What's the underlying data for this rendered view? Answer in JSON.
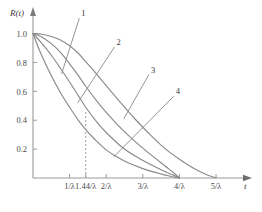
{
  "chart_data": {
    "type": "line",
    "title": "",
    "xlabel": "t",
    "ylabel": "R(t)",
    "grid": false,
    "legend_position": "inline-labels",
    "xlim": [
      0,
      5.6
    ],
    "ylim": [
      0,
      1.08
    ],
    "y_ticks": [
      "1.0",
      "0.8",
      "0.6",
      "0.4",
      "0.2"
    ],
    "y_tick_values": [
      1.0,
      0.8,
      0.6,
      0.4,
      0.2
    ],
    "x_ticks": [
      "1/λ",
      "1.44/λ",
      "2/λ",
      "3/λ",
      "4/λ",
      "5/λ"
    ],
    "x_tick_values": [
      1.0,
      1.44,
      2.0,
      3.0,
      4.0,
      5.0
    ],
    "annotations": [
      {
        "name": "dashed-reference-line",
        "x": 1.44,
        "label": "1.44/λ",
        "style": "dashed-vertical"
      }
    ],
    "series": [
      {
        "name": "1",
        "label": "1",
        "color": "#8a8a8a",
        "x": [
          0.0,
          0.25,
          0.5,
          0.75,
          1.0,
          1.25,
          1.44,
          1.6,
          2.0,
          2.4,
          2.8,
          3.2,
          3.6,
          4.0,
          4.4,
          4.7,
          5.0
        ],
        "y": [
          1.0,
          0.995,
          0.98,
          0.955,
          0.915,
          0.86,
          0.805,
          0.76,
          0.64,
          0.52,
          0.405,
          0.3,
          0.205,
          0.13,
          0.065,
          0.028,
          0.0
        ]
      },
      {
        "name": "2",
        "label": "2",
        "color": "#8a8a8a",
        "x": [
          0.0,
          0.25,
          0.5,
          0.75,
          1.0,
          1.25,
          1.44,
          1.75,
          2.0,
          2.4,
          2.8,
          3.2,
          3.6,
          3.85,
          4.0
        ],
        "y": [
          1.0,
          0.975,
          0.93,
          0.87,
          0.79,
          0.705,
          0.635,
          0.53,
          0.455,
          0.345,
          0.25,
          0.165,
          0.085,
          0.035,
          0.0
        ]
      },
      {
        "name": "3",
        "label": "3",
        "color": "#8a8a8a",
        "x": [
          0.0,
          0.25,
          0.5,
          0.75,
          1.0,
          1.25,
          1.44,
          1.75,
          2.0,
          2.4,
          2.8,
          3.2,
          3.6,
          3.85,
          4.0
        ],
        "y": [
          1.0,
          0.93,
          0.85,
          0.76,
          0.665,
          0.565,
          0.49,
          0.385,
          0.315,
          0.22,
          0.15,
          0.095,
          0.045,
          0.018,
          0.0
        ]
      },
      {
        "name": "4",
        "label": "4",
        "color": "#8a8a8a",
        "x": [
          0.0,
          0.2,
          0.4,
          0.6,
          0.8,
          1.0,
          1.25,
          1.44,
          1.7,
          2.0,
          2.3,
          2.6,
          3.0,
          3.4,
          3.75,
          4.0
        ],
        "y": [
          1.0,
          0.87,
          0.76,
          0.66,
          0.57,
          0.49,
          0.395,
          0.335,
          0.265,
          0.195,
          0.145,
          0.105,
          0.065,
          0.035,
          0.012,
          0.0
        ]
      }
    ],
    "curve_labels": [
      {
        "text": "1",
        "anchor_x": 1.32,
        "anchor_y": 1.12,
        "leader_to_x": 0.78,
        "leader_to_y": 0.72
      },
      {
        "text": "2",
        "anchor_x": 2.28,
        "anchor_y": 0.92,
        "leader_to_x": 1.22,
        "leader_to_y": 0.52
      },
      {
        "text": "3",
        "anchor_x": 3.22,
        "anchor_y": 0.73,
        "leader_to_x": 2.48,
        "leader_to_y": 0.41
      },
      {
        "text": "4",
        "anchor_x": 3.9,
        "anchor_y": 0.58,
        "leader_to_x": 2.2,
        "leader_to_y": 0.145
      }
    ]
  },
  "axes": {
    "y_axis_title": "R(t)",
    "x_axis_title": "t"
  },
  "colors": {
    "curve": "#8a8a8a",
    "axis": "#9a9a9a",
    "text": "#3a3a3a",
    "dashed": "#a8a8a8"
  }
}
